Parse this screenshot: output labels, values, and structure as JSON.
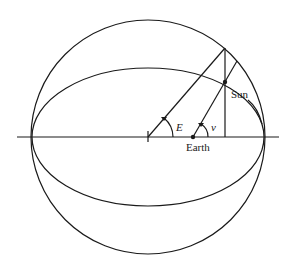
{
  "diagram": {
    "title": "",
    "labels": {
      "sun": "Sun",
      "earth": "Earth",
      "eccentric_anomaly": "E",
      "true_anomaly": "ν"
    },
    "elements": [
      "auxiliary circle",
      "orbit ellipse",
      "major axis",
      "center mark",
      "eccentric anomaly line",
      "true anomaly line",
      "perpendicular from circle to major axis",
      "Earth at focus",
      "body position on ellipse"
    ]
  }
}
